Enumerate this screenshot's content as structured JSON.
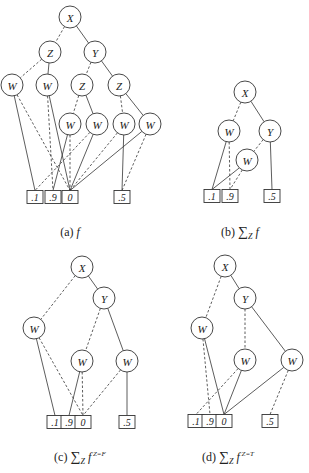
{
  "figure": {
    "node_radius": 11,
    "leaf_size": {
      "w": 16,
      "h": 13
    },
    "colors": {
      "stroke": "#333333",
      "text": "#222222",
      "background": "#ffffff"
    },
    "panels": [
      {
        "id": "a",
        "caption": {
          "label": "(a)",
          "sum": "",
          "sub": "",
          "func": "f",
          "sup": "",
          "x": 70,
          "y": 236
        },
        "nodes": [
          {
            "id": "X",
            "label": "X",
            "x": 70,
            "y": 17
          },
          {
            "id": "Z1",
            "label": "Z",
            "x": 50,
            "y": 52
          },
          {
            "id": "Y",
            "label": "Y",
            "x": 95,
            "y": 52
          },
          {
            "id": "W1",
            "label": "W",
            "x": 12,
            "y": 85
          },
          {
            "id": "W2",
            "label": "W",
            "x": 47,
            "y": 85
          },
          {
            "id": "Z2",
            "label": "Z",
            "x": 82,
            "y": 85
          },
          {
            "id": "Z3",
            "label": "Z",
            "x": 119,
            "y": 85
          },
          {
            "id": "W3",
            "label": "W",
            "x": 70,
            "y": 124
          },
          {
            "id": "W4",
            "label": "W",
            "x": 97,
            "y": 124
          },
          {
            "id": "W5",
            "label": "W",
            "x": 124,
            "y": 124
          },
          {
            "id": "W6",
            "label": "W",
            "x": 150,
            "y": 124
          }
        ],
        "leaves": [
          {
            "id": "L1",
            "label": ".1",
            "x": 35,
            "y": 197
          },
          {
            "id": "L9",
            "label": ".9",
            "x": 53,
            "y": 197
          },
          {
            "id": "L0",
            "label": "0",
            "x": 70,
            "y": 197
          },
          {
            "id": "L5",
            "label": ".5",
            "x": 122,
            "y": 197
          }
        ],
        "edges": [
          {
            "from": "X",
            "to": "Z1",
            "style": "dashed"
          },
          {
            "from": "X",
            "to": "Y",
            "style": "solid"
          },
          {
            "from": "Z1",
            "to": "W1",
            "style": "dashed"
          },
          {
            "from": "Z1",
            "to": "W2",
            "style": "solid"
          },
          {
            "from": "Y",
            "to": "Z2",
            "style": "dashed"
          },
          {
            "from": "Y",
            "to": "Z3",
            "style": "solid"
          },
          {
            "from": "Z2",
            "to": "W3",
            "style": "dashed"
          },
          {
            "from": "Z2",
            "to": "W4",
            "style": "solid"
          },
          {
            "from": "Z3",
            "to": "W5",
            "style": "dashed"
          },
          {
            "from": "Z3",
            "to": "W6",
            "style": "solid"
          },
          {
            "from": "W1",
            "to": "L1",
            "style": "solid"
          },
          {
            "from": "W1",
            "to": "L0",
            "style": "dashed"
          },
          {
            "from": "W2",
            "to": "L9",
            "style": "dashed"
          },
          {
            "from": "W2",
            "to": "L0",
            "style": "solid"
          },
          {
            "from": "W3",
            "to": "L9",
            "style": "solid"
          },
          {
            "from": "W3",
            "to": "L0",
            "style": "dashed"
          },
          {
            "from": "W4",
            "to": "L1",
            "style": "dashed"
          },
          {
            "from": "W4",
            "to": "L0",
            "style": "solid"
          },
          {
            "from": "W5",
            "to": "L0",
            "style": "dashed"
          },
          {
            "from": "W5",
            "to": "L5",
            "style": "solid"
          },
          {
            "from": "W6",
            "to": "L0",
            "style": "solid"
          },
          {
            "from": "W6",
            "to": "L5",
            "style": "dashed"
          }
        ]
      },
      {
        "id": "b",
        "caption": {
          "label": "(b)",
          "sum": "∑",
          "sub": "Z",
          "func": "f",
          "sup": "",
          "x": 240,
          "y": 236
        },
        "nodes": [
          {
            "id": "X",
            "label": "X",
            "x": 245,
            "y": 92
          },
          {
            "id": "W1",
            "label": "W",
            "x": 229,
            "y": 131
          },
          {
            "id": "Y",
            "label": "Y",
            "x": 270,
            "y": 131
          },
          {
            "id": "W2",
            "label": "W",
            "x": 247,
            "y": 160
          }
        ],
        "leaves": [
          {
            "id": "L1",
            "label": ".1",
            "x": 212,
            "y": 196
          },
          {
            "id": "L9",
            "label": ".9",
            "x": 230,
            "y": 196
          },
          {
            "id": "L5",
            "label": ".5",
            "x": 272,
            "y": 196
          }
        ],
        "edges": [
          {
            "from": "X",
            "to": "W1",
            "style": "dashed"
          },
          {
            "from": "X",
            "to": "Y",
            "style": "solid"
          },
          {
            "from": "Y",
            "to": "W2",
            "style": "dashed"
          },
          {
            "from": "Y",
            "to": "L5",
            "style": "solid"
          },
          {
            "from": "W1",
            "to": "L1",
            "style": "solid"
          },
          {
            "from": "W1",
            "to": "L9",
            "style": "dashed"
          },
          {
            "from": "W2",
            "to": "L1",
            "style": "solid"
          },
          {
            "from": "W2",
            "to": "L9",
            "style": "dashed"
          }
        ]
      },
      {
        "id": "c",
        "caption": {
          "label": "(c)",
          "sum": "∑",
          "sub": "Z",
          "func": "f",
          "sup": "Z=F",
          "x": 80,
          "y": 461
        },
        "nodes": [
          {
            "id": "X",
            "label": "X",
            "x": 82,
            "y": 267
          },
          {
            "id": "Y",
            "label": "Y",
            "x": 104,
            "y": 298
          },
          {
            "id": "W1",
            "label": "W",
            "x": 34,
            "y": 328
          },
          {
            "id": "W2",
            "label": "W",
            "x": 82,
            "y": 361
          },
          {
            "id": "W3",
            "label": "W",
            "x": 127,
            "y": 361
          }
        ],
        "leaves": [
          {
            "id": "L1",
            "label": ".1",
            "x": 55,
            "y": 422
          },
          {
            "id": "L9",
            "label": ".9",
            "x": 69,
            "y": 422
          },
          {
            "id": "L0",
            "label": "0",
            "x": 83,
            "y": 422
          },
          {
            "id": "L5",
            "label": ".5",
            "x": 127,
            "y": 422
          }
        ],
        "edges": [
          {
            "from": "X",
            "to": "W1",
            "style": "dashed"
          },
          {
            "from": "X",
            "to": "Y",
            "style": "solid"
          },
          {
            "from": "Y",
            "to": "W2",
            "style": "dashed"
          },
          {
            "from": "Y",
            "to": "W3",
            "style": "solid"
          },
          {
            "from": "W1",
            "to": "L1",
            "style": "solid"
          },
          {
            "from": "W1",
            "to": "L0",
            "style": "dashed"
          },
          {
            "from": "W2",
            "to": "L9",
            "style": "solid"
          },
          {
            "from": "W2",
            "to": "L0",
            "style": "dashed"
          },
          {
            "from": "W3",
            "to": "L0",
            "style": "dashed"
          },
          {
            "from": "W3",
            "to": "L5",
            "style": "solid"
          }
        ]
      },
      {
        "id": "d",
        "caption": {
          "label": "(d)",
          "sum": "∑",
          "sub": "Z",
          "func": "f",
          "sup": "Z=T",
          "x": 228,
          "y": 461
        },
        "nodes": [
          {
            "id": "X",
            "label": "X",
            "x": 225,
            "y": 266
          },
          {
            "id": "Y",
            "label": "Y",
            "x": 245,
            "y": 298
          },
          {
            "id": "W1",
            "label": "W",
            "x": 202,
            "y": 328
          },
          {
            "id": "W2",
            "label": "W",
            "x": 245,
            "y": 360
          },
          {
            "id": "W3",
            "label": "W",
            "x": 292,
            "y": 360
          }
        ],
        "leaves": [
          {
            "id": "L1",
            "label": ".1",
            "x": 196,
            "y": 421
          },
          {
            "id": "L9",
            "label": ".9",
            "x": 210,
            "y": 421
          },
          {
            "id": "L0",
            "label": "0",
            "x": 224,
            "y": 421
          },
          {
            "id": "L5",
            "label": ".5",
            "x": 270,
            "y": 421
          }
        ],
        "edges": [
          {
            "from": "X",
            "to": "W1",
            "style": "dashed"
          },
          {
            "from": "X",
            "to": "Y",
            "style": "solid"
          },
          {
            "from": "Y",
            "to": "W2",
            "style": "dashed"
          },
          {
            "from": "Y",
            "to": "W3",
            "style": "solid"
          },
          {
            "from": "W1",
            "to": "L9",
            "style": "dashed"
          },
          {
            "from": "W1",
            "to": "L0",
            "style": "solid"
          },
          {
            "from": "W2",
            "to": "L1",
            "style": "dashed"
          },
          {
            "from": "W2",
            "to": "L0",
            "style": "solid"
          },
          {
            "from": "W3",
            "to": "L0",
            "style": "solid"
          },
          {
            "from": "W3",
            "to": "L5",
            "style": "dashed"
          }
        ]
      }
    ]
  }
}
